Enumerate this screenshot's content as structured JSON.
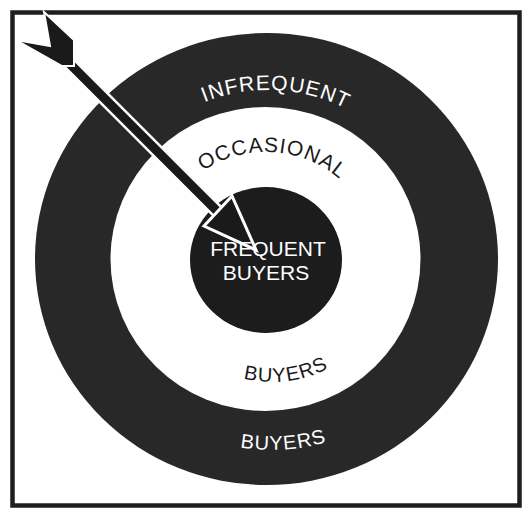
{
  "diagram": {
    "type": "target-bullseye",
    "colors": {
      "background": "#ffffff",
      "frame": "#1e1e1e",
      "ring_dark": "#282828",
      "ring_light": "#ffffff",
      "bullseye": "#1c1c1c",
      "text_on_dark": "#ffffff",
      "text_on_light": "#1a1a1a",
      "arrow_fill": "#1a1a1a",
      "arrow_outline": "#ffffff"
    },
    "rings": [
      {
        "id": "outer",
        "label_top": "INFREQUENT",
        "label_bottom": "BUYERS",
        "fill": "dark"
      },
      {
        "id": "middle",
        "label_top": "OCCASIONAL",
        "label_bottom": "BUYERS",
        "fill": "light"
      },
      {
        "id": "center",
        "label_line1": "FREQUENT",
        "label_line2": "BUYERS",
        "fill": "dark"
      }
    ],
    "arrow": {
      "description": "arrow striking the bullseye from upper-left",
      "target": "center"
    }
  }
}
